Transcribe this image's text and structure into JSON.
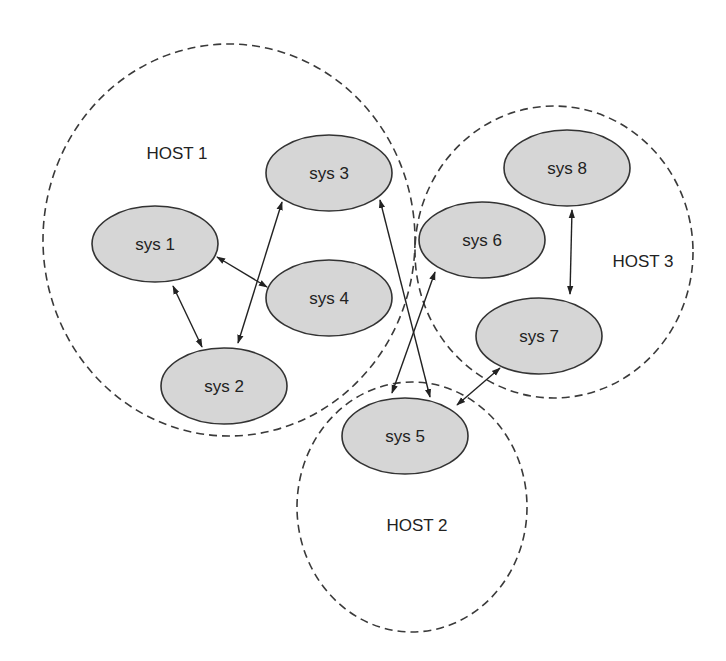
{
  "diagram": {
    "hosts": [
      {
        "id": "host1",
        "label": "HOST 1",
        "cx": 229,
        "cy": 240,
        "rx": 186,
        "ry": 196,
        "label_x": 177,
        "label_y": 153
      },
      {
        "id": "host2",
        "label": "HOST 2",
        "cx": 412,
        "cy": 507,
        "rx": 115,
        "ry": 125,
        "label_x": 417,
        "label_y": 525
      },
      {
        "id": "host3",
        "label": "HOST 3",
        "cx": 554,
        "cy": 252,
        "rx": 139,
        "ry": 146,
        "label_x": 643,
        "label_y": 261
      }
    ],
    "nodes": [
      {
        "id": "sys1",
        "label": "sys 1",
        "host": "HOST 1",
        "cx": 155,
        "cy": 244
      },
      {
        "id": "sys2",
        "label": "sys 2",
        "host": "HOST 1",
        "cx": 224,
        "cy": 386
      },
      {
        "id": "sys3",
        "label": "sys 3",
        "host": "HOST 1",
        "cx": 329,
        "cy": 173
      },
      {
        "id": "sys4",
        "label": "sys 4",
        "host": "HOST 1",
        "cx": 329,
        "cy": 298
      },
      {
        "id": "sys5",
        "label": "sys 5",
        "host": "HOST 2",
        "cx": 405,
        "cy": 436
      },
      {
        "id": "sys6",
        "label": "sys 6",
        "host": "HOST 3",
        "cx": 482,
        "cy": 240
      },
      {
        "id": "sys7",
        "label": "sys 7",
        "host": "HOST 3",
        "cx": 539,
        "cy": 336
      },
      {
        "id": "sys8",
        "label": "sys 8",
        "host": "HOST 3",
        "cx": 567,
        "cy": 168
      }
    ],
    "node_size": {
      "rx": 63,
      "ry": 38
    },
    "edges": [
      {
        "from": "sys1",
        "to": "sys2",
        "bidirectional": true,
        "x1": 173,
        "y1": 286,
        "x2": 202,
        "y2": 347
      },
      {
        "from": "sys1",
        "to": "sys4",
        "bidirectional": true,
        "x1": 217,
        "y1": 257,
        "x2": 267,
        "y2": 287
      },
      {
        "from": "sys2",
        "to": "sys3",
        "bidirectional": true,
        "x1": 238,
        "y1": 343,
        "x2": 282,
        "y2": 202
      },
      {
        "from": "sys3",
        "to": "sys5",
        "bidirectional": true,
        "x1": 380,
        "y1": 200,
        "x2": 430,
        "y2": 397
      },
      {
        "from": "sys6",
        "to": "sys5",
        "bidirectional": true,
        "x1": 435,
        "y1": 272,
        "x2": 392,
        "y2": 393
      },
      {
        "from": "sys7",
        "to": "sys5",
        "bidirectional": true,
        "x1": 500,
        "y1": 368,
        "x2": 457,
        "y2": 405
      },
      {
        "from": "sys8",
        "to": "sys7",
        "bidirectional": true,
        "x1": 572,
        "y1": 210,
        "x2": 570,
        "y2": 294
      }
    ],
    "colors": {
      "node_fill": "#d6d6d6",
      "node_stroke": "#333333",
      "host_stroke": "#3a3a3a",
      "edge": "#222222"
    }
  }
}
